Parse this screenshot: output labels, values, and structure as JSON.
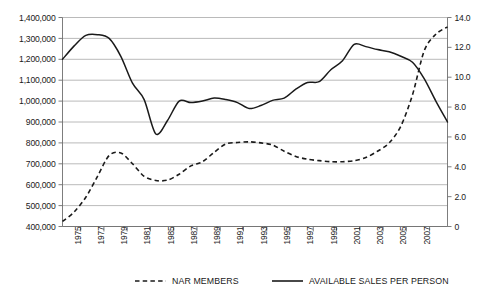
{
  "chart_data": {
    "type": "line",
    "title": "",
    "subtitle": "",
    "xlabel": "",
    "ylabel": "",
    "y2label": "",
    "grid": true,
    "legend_position": "bottom",
    "x": [
      1975,
      1976,
      1977,
      1978,
      1979,
      1980,
      1981,
      1982,
      1983,
      1984,
      1985,
      1986,
      1987,
      1988,
      1989,
      1990,
      1991,
      1992,
      1993,
      1994,
      1995,
      1996,
      1997,
      1998,
      1999,
      2000,
      2001,
      2002,
      2003,
      2004,
      2005,
      2006,
      2007,
      2008
    ],
    "x_tick_labels": [
      "1975",
      "1977",
      "1979",
      "1981",
      "1985",
      "1987",
      "1989",
      "1991",
      "1993",
      "1995",
      "1997",
      "1999",
      "2001",
      "2003",
      "2005",
      "2007"
    ],
    "ylim": [
      400000,
      1400000
    ],
    "y_ticks": [
      400000,
      500000,
      600000,
      700000,
      800000,
      900000,
      1000000,
      1100000,
      1200000,
      1300000,
      1400000
    ],
    "y_tick_labels": [
      "400,000",
      "500,000",
      "600,000",
      "700,000",
      "800,000",
      "900,000",
      "1,000,000",
      "1,100,000",
      "1,200,000",
      "1,300,000",
      "1,400,000"
    ],
    "y2lim": [
      0,
      14
    ],
    "y2_ticks": [
      0,
      2,
      4,
      6,
      8,
      10,
      12,
      14
    ],
    "y2_tick_labels": [
      "0",
      "2.0",
      "4.0",
      "6.0",
      "8.0",
      "10.0",
      "12.0",
      "14.0"
    ],
    "series": [
      {
        "name": "NAR MEMBERS",
        "axis": "left",
        "style": "dashed",
        "color": "#1a1a1a",
        "values": [
          424000,
          470000,
          540000,
          640000,
          740000,
          752000,
          700000,
          640000,
          620000,
          622000,
          650000,
          690000,
          710000,
          755000,
          795000,
          802000,
          805000,
          800000,
          790000,
          760000,
          735000,
          722000,
          715000,
          710000,
          710000,
          715000,
          730000,
          760000,
          800000,
          880000,
          1030000,
          1240000,
          1320000,
          1355000
        ]
      },
      {
        "name": "AVAILABLE SALES PER PERSON",
        "axis": "right",
        "style": "solid",
        "color": "#1a1a1a",
        "values": [
          11.2,
          12.1,
          12.8,
          12.85,
          12.6,
          11.4,
          9.6,
          8.5,
          6.2,
          7.1,
          8.4,
          8.3,
          8.4,
          8.6,
          8.5,
          8.3,
          7.9,
          8.1,
          8.45,
          8.6,
          9.2,
          9.65,
          9.7,
          10.5,
          11.1,
          12.2,
          12.05,
          11.85,
          11.7,
          11.4,
          11.0,
          9.9,
          8.4,
          7.0
        ]
      }
    ],
    "legend": [
      {
        "label": "NAR MEMBERS",
        "style": "dashed"
      },
      {
        "label": "AVAILABLE SALES PER PERSON",
        "style": "solid"
      }
    ]
  }
}
